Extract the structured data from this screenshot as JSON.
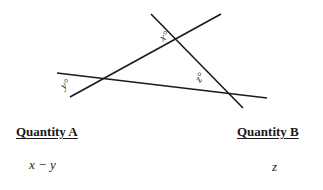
{
  "figure": {
    "lines": [
      {
        "name": "line-rising",
        "x1": 70,
        "y1": 97,
        "x2": 221,
        "y2": 14
      },
      {
        "name": "line-steep",
        "x1": 151,
        "y1": 14,
        "x2": 243,
        "y2": 108
      },
      {
        "name": "line-shallow",
        "x1": 57,
        "y1": 73,
        "x2": 267,
        "y2": 98
      }
    ],
    "angles": [
      {
        "label": "x°",
        "x": 163,
        "y": 42,
        "rotate": -40
      },
      {
        "label": "y°",
        "x": 66,
        "y": 89,
        "rotate": -40
      },
      {
        "label": "z°",
        "x": 199,
        "y": 80,
        "rotate": -55
      }
    ],
    "stroke_color": "#1a1a1a"
  },
  "quantity_a": {
    "label": "Quantity A",
    "value": "x − y"
  },
  "quantity_b": {
    "label": "Quantity B",
    "value": "z"
  }
}
